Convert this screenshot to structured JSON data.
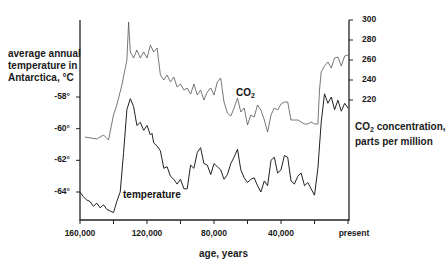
{
  "chart_data": {
    "type": "line",
    "title": "",
    "xlabel": "age, years",
    "ylabel_left": "average annual temperature in Antarctica, °C",
    "ylabel_right": "CO2 concentration, parts per million",
    "ylabel_right_parts": {
      "pre": "CO",
      "sub": "2",
      "post": " concentration, parts per million"
    },
    "x_ticks": [
      {
        "value": 160000,
        "label": "160,000"
      },
      {
        "value": 120000,
        "label": "120,000"
      },
      {
        "value": 80000,
        "label": "80,000"
      },
      {
        "value": 40000,
        "label": "40,000"
      },
      {
        "value": 0,
        "label": "present"
      }
    ],
    "x_minor_ticks": [
      140000,
      100000,
      60000,
      20000
    ],
    "xlim": [
      160000,
      0
    ],
    "y_left_ticks": [
      {
        "value": -58,
        "label": "-58°"
      },
      {
        "value": -60,
        "label": "-60°"
      },
      {
        "value": -62,
        "label": "-62°"
      },
      {
        "value": -64,
        "label": "-64°"
      }
    ],
    "y_right_ticks": [
      {
        "value": 300,
        "label": "300"
      },
      {
        "value": 280,
        "label": "280"
      },
      {
        "value": 260,
        "label": "260"
      },
      {
        "value": 240,
        "label": "240"
      },
      {
        "value": 220,
        "label": "220"
      }
    ],
    "grid": false,
    "legend": "inline labels",
    "series": [
      {
        "name": "CO2",
        "label_parts": {
          "pre": "CO",
          "sub": "2"
        },
        "axis": "right",
        "color": "#555555",
        "x": [
          157000,
          150000,
          146000,
          143000,
          140000,
          138000,
          135000,
          132000,
          131000,
          130000,
          128000,
          126000,
          124000,
          122000,
          120000,
          118000,
          116000,
          114000,
          112000,
          110000,
          108000,
          106000,
          104000,
          102000,
          100000,
          98000,
          96000,
          94000,
          92000,
          90000,
          88000,
          86000,
          84000,
          82000,
          80000,
          78000,
          76000,
          74000,
          72000,
          70000,
          68000,
          66000,
          64000,
          62000,
          60000,
          58000,
          56000,
          54000,
          52000,
          50000,
          48000,
          46000,
          44000,
          42000,
          40000,
          38000,
          36000,
          34000,
          32000,
          30000,
          28000,
          26000,
          24000,
          22000,
          20000,
          18000,
          17000,
          16000,
          14000,
          12000,
          10000,
          8000,
          6000,
          4000,
          2000,
          0
        ],
        "y": [
          183,
          181,
          185,
          180,
          205,
          215,
          235,
          260,
          298,
          268,
          262,
          270,
          262,
          268,
          262,
          275,
          268,
          272,
          245,
          240,
          245,
          238,
          243,
          233,
          236,
          230,
          232,
          226,
          236,
          225,
          230,
          220,
          228,
          232,
          225,
          238,
          242,
          218,
          207,
          204,
          212,
          222,
          208,
          212,
          195,
          205,
          203,
          215,
          210,
          200,
          188,
          205,
          212,
          210,
          216,
          218,
          218,
          200,
          200,
          200,
          198,
          196,
          196,
          198,
          196,
          196,
          230,
          248,
          254,
          258,
          252,
          262,
          263,
          254,
          264,
          265
        ]
      },
      {
        "name": "temperature",
        "axis": "left",
        "color": "#222222",
        "x": [
          160000,
          158000,
          156000,
          154000,
          152000,
          150000,
          148000,
          146000,
          144000,
          142000,
          140000,
          138000,
          136000,
          134000,
          132000,
          130000,
          128000,
          126000,
          124000,
          122000,
          120000,
          118000,
          117000,
          116000,
          114000,
          112000,
          110000,
          108000,
          106000,
          104000,
          102000,
          100000,
          98000,
          96000,
          94000,
          92000,
          90000,
          88000,
          86000,
          84000,
          82000,
          80000,
          78000,
          76000,
          74000,
          72000,
          70000,
          68000,
          66000,
          64000,
          62000,
          60000,
          58000,
          56000,
          54000,
          52000,
          50000,
          48000,
          46000,
          44000,
          42000,
          40000,
          38000,
          36000,
          34000,
          32000,
          30000,
          28000,
          26000,
          24000,
          22000,
          20000,
          18000,
          16000,
          14000,
          12000,
          10000,
          8000,
          6000,
          4000,
          2000,
          0
        ],
        "y": [
          -64.0,
          -64.3,
          -64.5,
          -64.6,
          -64.9,
          -64.7,
          -65.0,
          -64.8,
          -65.1,
          -65.2,
          -65.3,
          -64.6,
          -64.0,
          -61.5,
          -58.8,
          -58.1,
          -58.6,
          -59.8,
          -59.6,
          -60.1,
          -59.8,
          -60.4,
          -60.3,
          -60.9,
          -61.1,
          -61.4,
          -62.5,
          -62.4,
          -63.0,
          -63.2,
          -63.5,
          -63.2,
          -63.8,
          -63.8,
          -62.3,
          -62.5,
          -61.5,
          -61.2,
          -62.2,
          -62.3,
          -62.9,
          -62.2,
          -62.4,
          -62.6,
          -63.2,
          -62.9,
          -62.2,
          -61.8,
          -61.3,
          -62.6,
          -63.1,
          -63.4,
          -63.2,
          -63.1,
          -63.6,
          -64.0,
          -63.3,
          -63.6,
          -62.0,
          -61.8,
          -62.8,
          -62.6,
          -61.7,
          -61.8,
          -63.3,
          -63.5,
          -63.0,
          -62.8,
          -63.6,
          -63.4,
          -63.8,
          -64.2,
          -62.5,
          -59.6,
          -57.8,
          -58.4,
          -58.0,
          -58.8,
          -58.2,
          -58.9,
          -58.4,
          -58.7
        ]
      }
    ]
  }
}
